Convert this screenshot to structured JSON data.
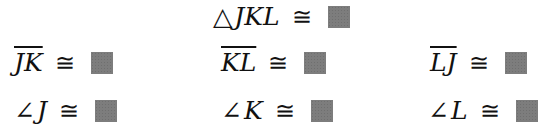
{
  "statements": {
    "triangle": {
      "symbol": "△",
      "label": "JKL",
      "relation": "≅",
      "answer_state": "blank"
    },
    "sides": [
      {
        "label": "JK",
        "relation": "≅",
        "answer_state": "blank"
      },
      {
        "label": "KL",
        "relation": "≅",
        "answer_state": "blank"
      },
      {
        "label": "LJ",
        "relation": "≅",
        "answer_state": "blank"
      }
    ],
    "angles": [
      {
        "symbol": "∠",
        "label": "J",
        "relation": "≅",
        "answer_state": "blank"
      },
      {
        "symbol": "∠",
        "label": "K",
        "relation": "≅",
        "answer_state": "blank"
      },
      {
        "symbol": "∠",
        "label": "L",
        "relation": "≅",
        "answer_state": "blank"
      }
    ]
  },
  "colors": {
    "text": "#111111",
    "blank_box": "#7d7d7d"
  }
}
